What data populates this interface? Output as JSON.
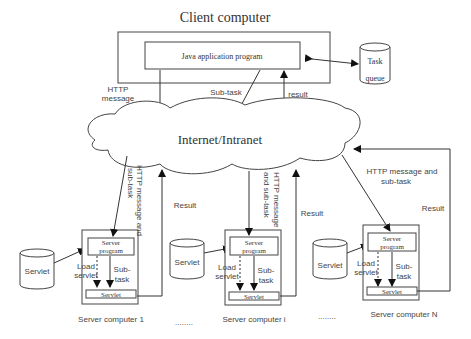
{
  "title": "Client computer",
  "client": {
    "app_label": "Java application program",
    "http_message_line1": "HTTP",
    "http_message_line2": "message",
    "subtask_label": "Sub-task",
    "result_label": "result"
  },
  "task_queue": {
    "line1": "Task",
    "line2": "queue"
  },
  "network": {
    "label": "Internet/Intranet"
  },
  "servers": [
    {
      "name": "Server computer 1",
      "servlet_store": "Servlet",
      "server_program_line1": "Server",
      "server_program_line2": "program",
      "load_line1": "Load",
      "load_line2": "servlet",
      "sub_line1": "Sub-",
      "sub_line2": "task",
      "servlet_box": "Servlet",
      "in_label_line1": "HTTP message and",
      "in_label_line2": "sub-task",
      "result_label": "Result"
    },
    {
      "name": "Server computer i",
      "servlet_store": "Servlet",
      "server_program_line1": "Server",
      "server_program_line2": "program",
      "load_line1": "Load",
      "load_line2": "servlet",
      "sub_line1": "Sub-",
      "sub_line2": "task",
      "servlet_box": "Servlet",
      "in_label_line1": "HTTP message",
      "in_label_line2": "and sub-task",
      "result_label": "Result"
    },
    {
      "name": "Server computer N",
      "servlet_store": "Servlet",
      "server_program_line1": "Server",
      "server_program_line2": "program",
      "load_line1": "Load",
      "load_line2": "servlet",
      "sub_line1": "Sub-",
      "sub_line2": "task",
      "servlet_box": "Servlet",
      "in_label_line1": "HTTP message and",
      "in_label_line2": "sub-task",
      "result_label": "Result"
    }
  ],
  "ellipsis": "........"
}
